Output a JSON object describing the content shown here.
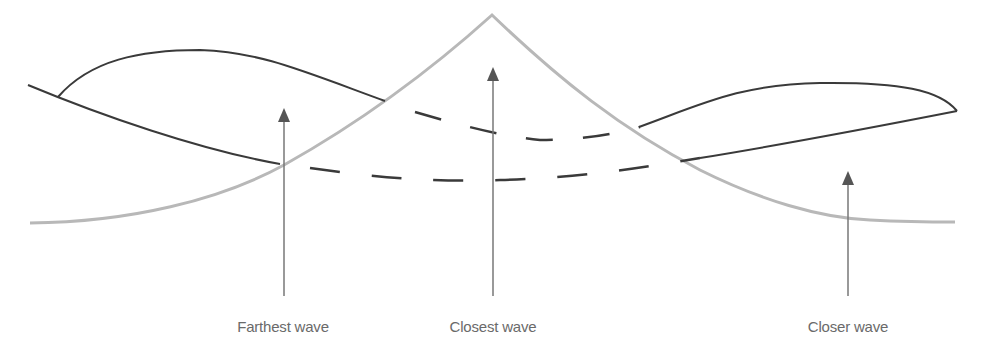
{
  "diagram": {
    "type": "wave-interference-illustration",
    "colors": {
      "background": "#ffffff",
      "dark_wave": "#3a3a3a",
      "closest_wave_curve": "#b8b8b8",
      "arrow": "#666666",
      "label_text": "#6a6a6a"
    },
    "labels": [
      {
        "id": "farthest",
        "text": "Farthest wave",
        "x": 283
      },
      {
        "id": "closest",
        "text": "Closest wave",
        "x": 493
      },
      {
        "id": "closer",
        "text": "Closer wave",
        "x": 848
      }
    ],
    "arrows": [
      {
        "id": "farthest",
        "x": 284,
        "y_top": 108,
        "y_bottom": 296
      },
      {
        "id": "closest",
        "x": 493,
        "y_top": 67,
        "y_bottom": 296
      },
      {
        "id": "closer",
        "x": 848,
        "y_top": 171,
        "y_bottom": 296
      }
    ]
  }
}
